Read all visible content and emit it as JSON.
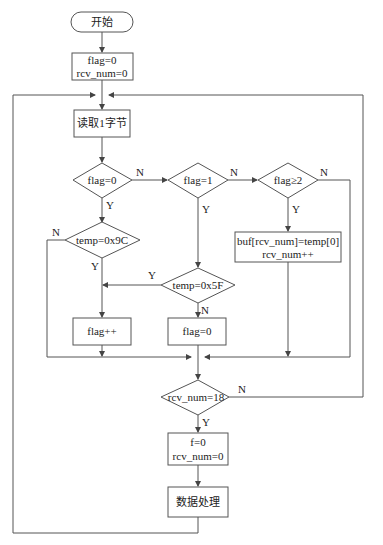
{
  "flowchart": {
    "start": {
      "label": "开始"
    },
    "init": {
      "line1": "flag=0",
      "line2": "rcv_num=0"
    },
    "read": {
      "label": "读取1字节"
    },
    "decisions": {
      "flag_eq_0": {
        "label": "flag=0",
        "yes": "Y",
        "no": "N"
      },
      "flag_eq_1": {
        "label": "flag=1",
        "yes": "Y",
        "no": "N"
      },
      "flag_ge_2": {
        "label": "flag≥2",
        "yes": "Y",
        "no": "N"
      },
      "temp_eq_9c": {
        "label": "temp=0x9C",
        "yes": "Y",
        "no": "N"
      },
      "temp_eq_5f": {
        "label": "temp=0x5F",
        "yes": "Y",
        "no": "N"
      },
      "rcv_num_eq_18": {
        "label": "rcv_num=18",
        "yes": "Y",
        "no": "N"
      }
    },
    "store": {
      "line1": "buf[rcv_num]=temp[0]",
      "line2": "rcv_num++"
    },
    "flag_inc": {
      "label": "flag++"
    },
    "flag_reset": {
      "label": "flag=0"
    },
    "reset": {
      "line1": "f=0",
      "line2": "rcv_num=0"
    },
    "process": {
      "label": "数据处理"
    }
  },
  "colors": {
    "stroke": "#555555",
    "text": "#222222",
    "background": "#ffffff"
  }
}
